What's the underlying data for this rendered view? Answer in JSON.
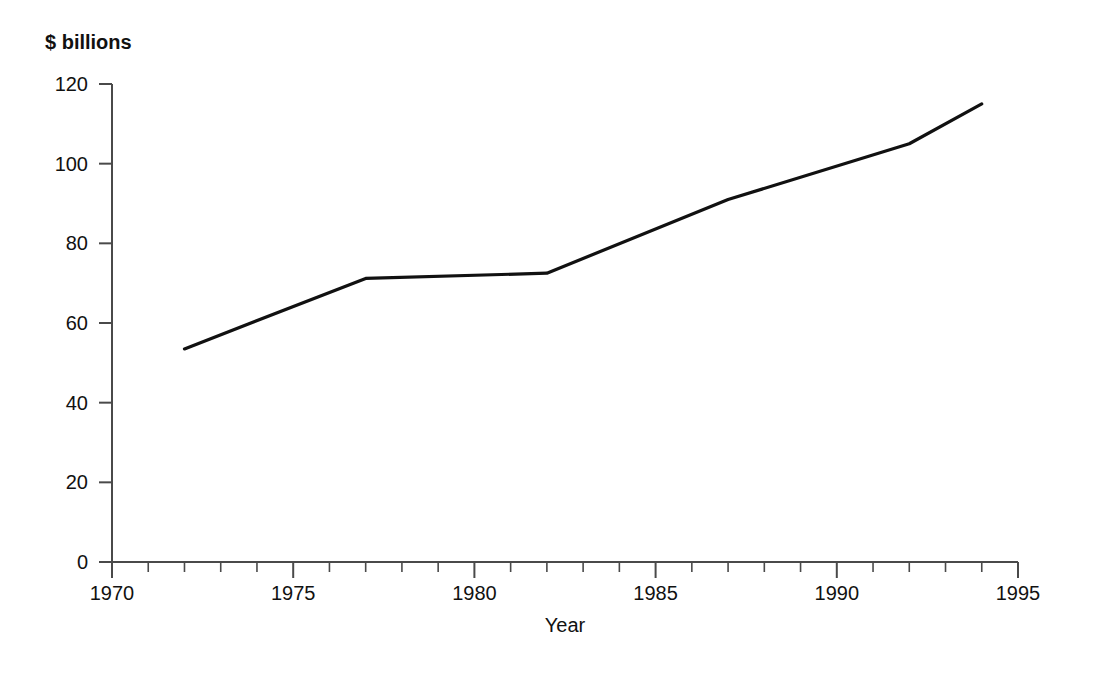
{
  "chart_data": {
    "type": "line",
    "title": "",
    "subtitle": "",
    "ylabel": "$ billions",
    "xlabel": "Year",
    "xlim": [
      1970,
      1995
    ],
    "ylim": [
      0,
      120
    ],
    "grid": false,
    "legend": null,
    "x_ticks": [
      1970,
      1975,
      1980,
      1985,
      1990,
      1995
    ],
    "x_tick_labels": [
      "1970",
      "1975",
      "1980",
      "1985",
      "1990",
      "1995"
    ],
    "x_minor_tick_step": 1,
    "y_ticks": [
      0,
      20,
      40,
      60,
      80,
      100,
      120
    ],
    "y_tick_labels": [
      "0",
      "20",
      "40",
      "60",
      "80",
      "100",
      "120"
    ],
    "series": [
      {
        "name": "value",
        "color": "#111111",
        "line_width": 3.2,
        "x": [
          1972,
          1977,
          1982,
          1987,
          1992,
          1994
        ],
        "values": [
          53.5,
          71.2,
          72.5,
          91.0,
          105.0,
          115.0
        ]
      }
    ]
  },
  "axis": {
    "y_title": "$ billions",
    "x_title": "Year"
  },
  "ticks": {
    "y": [
      "120",
      "100",
      "80",
      "60",
      "40",
      "20",
      "0"
    ],
    "x": [
      "1970",
      "1975",
      "1980",
      "1985",
      "1990",
      "1995"
    ]
  }
}
